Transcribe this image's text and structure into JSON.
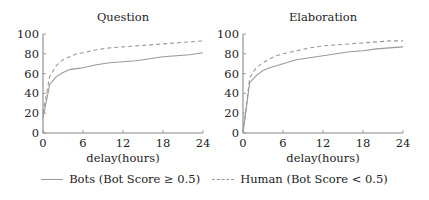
{
  "chart_data": [
    {
      "type": "line",
      "title": "Question",
      "xlabel": "delay(hours)",
      "ylabel": "",
      "xlim": [
        0,
        24
      ],
      "ylim": [
        0,
        100
      ],
      "xticks": [
        0,
        6,
        12,
        18,
        24
      ],
      "yticks": [
        0,
        20,
        40,
        60,
        80,
        100
      ],
      "grid": false,
      "series": [
        {
          "name": "Bots (Bot Score ≥ 0.5)",
          "style": "solid",
          "x": [
            0,
            1,
            2,
            3,
            4,
            5,
            6,
            8,
            10,
            12,
            14,
            16,
            18,
            20,
            22,
            24
          ],
          "values": [
            15,
            49,
            57,
            61,
            64,
            65,
            66,
            69,
            71,
            72,
            73,
            75,
            77,
            78,
            79,
            81
          ]
        },
        {
          "name": "Human (Bot Score < 0.5)",
          "style": "dashed",
          "x": [
            0,
            1,
            2,
            3,
            4,
            5,
            6,
            8,
            10,
            12,
            14,
            16,
            18,
            20,
            22,
            24
          ],
          "values": [
            20,
            57,
            68,
            74,
            77,
            80,
            81,
            84,
            86,
            87,
            88,
            89,
            90,
            91,
            92,
            93
          ]
        }
      ]
    },
    {
      "type": "line",
      "title": "Elaboration",
      "xlabel": "delay(hours)",
      "ylabel": "",
      "xlim": [
        0,
        24
      ],
      "ylim": [
        0,
        100
      ],
      "xticks": [
        0,
        6,
        12,
        18,
        24
      ],
      "yticks": [
        0,
        20,
        40,
        60,
        80,
        100
      ],
      "grid": false,
      "series": [
        {
          "name": "Bots (Bot Score ≥ 0.5)",
          "style": "solid",
          "x": [
            0,
            1,
            2,
            3,
            4,
            5,
            6,
            8,
            10,
            12,
            14,
            16,
            18,
            20,
            22,
            24
          ],
          "values": [
            0,
            51,
            58,
            63,
            66,
            68,
            70,
            74,
            76,
            78,
            80,
            82,
            83,
            85,
            86,
            87
          ]
        },
        {
          "name": "Human (Bot Score < 0.5)",
          "style": "dashed",
          "x": [
            0,
            1,
            2,
            3,
            4,
            5,
            6,
            8,
            10,
            12,
            14,
            16,
            18,
            20,
            22,
            24
          ],
          "values": [
            0,
            56,
            66,
            71,
            75,
            78,
            80,
            83,
            86,
            88,
            89,
            90,
            91,
            92,
            93,
            93
          ]
        }
      ]
    }
  ],
  "legend": {
    "position": "bottom",
    "items": [
      {
        "label": "Bots (Bot Score ≥ 0.5)",
        "style": "solid"
      },
      {
        "label": "Human (Bot Score < 0.5)",
        "style": "dashed"
      }
    ]
  },
  "colors": {
    "line": "#999999",
    "axis": "#888888",
    "text": "#222222"
  }
}
